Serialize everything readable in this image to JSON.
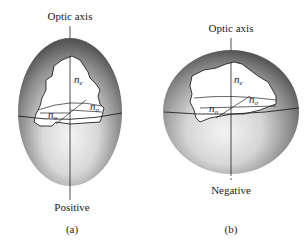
{
  "figure_a": {
    "top_label": "Optic axis",
    "bottom_label": "Positive",
    "caption": "(a)",
    "ne_label": "n",
    "ne_sub": "e",
    "no_label_right": "n",
    "no_sub_right": "o",
    "no_label_left": "n",
    "no_sub_left": "o"
  },
  "figure_b": {
    "top_label": "Optic axis",
    "bottom_label": "Negative",
    "caption": "(b)",
    "ne_label": "n",
    "ne_sub": "e",
    "no_label_right": "n",
    "no_sub_right": "o",
    "no_label_left": "n",
    "no_sub_left": "o"
  },
  "colors": {
    "ellipsoid_dark": "#5a5a5a",
    "ellipsoid_light": "#f2f2f2",
    "line": "#222222"
  }
}
